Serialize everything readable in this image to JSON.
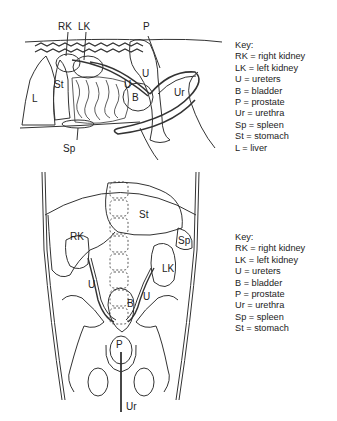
{
  "lateral_view": {
    "labels": {
      "rk": "RK",
      "lk": "LK",
      "p": "P",
      "u1": "U",
      "u2": "U",
      "st": "St",
      "l": "L",
      "b": "B",
      "ur": "Ur",
      "sp": "Sp"
    },
    "key": {
      "title": "Key:",
      "items": [
        "RK = right kidney",
        "LK = left kidney",
        "U = ureters",
        "B = bladder",
        "P = prostate",
        "Ur = urethra",
        "Sp = spleen",
        "St = stomach",
        "L = liver"
      ]
    }
  },
  "ventral_view": {
    "labels": {
      "st": "St",
      "rk": "RK",
      "sp": "Sp",
      "lk": "LK",
      "u1": "U",
      "u2": "U",
      "b": "B",
      "p": "P",
      "ur": "Ur"
    },
    "key": {
      "title": "Key:",
      "items": [
        "RK = right kidney",
        "LK = left kidney",
        "U = ureters",
        "B = bladder",
        "P = prostate",
        "Ur = urethra",
        "Sp = spleen",
        "St = stomach"
      ]
    }
  }
}
